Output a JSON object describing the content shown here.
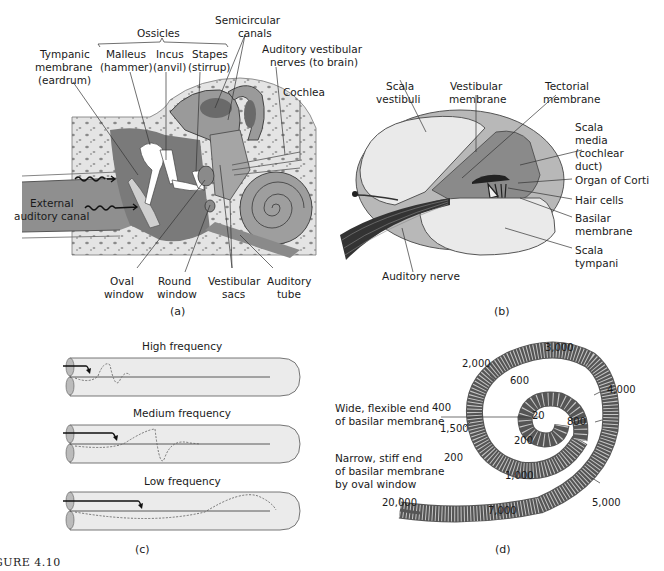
{
  "panel_a": {
    "letter": "(a)",
    "labels": {
      "ossicles": "Ossicles",
      "semicircular_1": "Semicircular",
      "semicircular_2": "canals",
      "tympanic_1": "Tympanic",
      "tympanic_2": "membrane",
      "tympanic_3": "(eardrum)",
      "malleus_1": "Malleus",
      "malleus_2": "(hammer)",
      "incus_1": "Incus",
      "incus_2": "(anvil)",
      "stapes_1": "Stapes",
      "stapes_2": "(stirrup)",
      "auditory_vestibular_1": "Auditory vestibular",
      "auditory_vestibular_2": "nerves (to brain)",
      "cochlea": "Cochlea",
      "external_1": "External",
      "external_2": "auditory canal",
      "oval_1": "Oval",
      "oval_2": "window",
      "round_1": "Round",
      "round_2": "window",
      "vestibular_1": "Vestibular",
      "vestibular_2": "sacs",
      "auditory_tube_1": "Auditory",
      "auditory_tube_2": "tube"
    }
  },
  "panel_b": {
    "letter": "(b)",
    "labels": {
      "scala_vestibuli_1": "Scala",
      "scala_vestibuli_2": "vestibuli",
      "vestibular_membrane_1": "Vestibular",
      "vestibular_membrane_2": "membrane",
      "tectorial_1": "Tectorial",
      "tectorial_2": "membrane",
      "scala_media_1": "Scala",
      "scala_media_2": "media",
      "scala_media_3": "(cochlear",
      "scala_media_4": "duct)",
      "organ_of_corti": "Organ of Corti",
      "hair_cells": "Hair cells",
      "basilar_1": "Basilar",
      "basilar_2": "membrane",
      "scala_tympani_1": "Scala",
      "scala_tympani_2": "tympani",
      "auditory_nerve": "Auditory nerve"
    }
  },
  "panel_c": {
    "letter": "(c)",
    "rows": [
      {
        "title": "High frequency"
      },
      {
        "title": "Medium frequency"
      },
      {
        "title": "Low frequency"
      }
    ]
  },
  "panel_d": {
    "letter": "(d)",
    "wide_end_1": "Wide, flexible end",
    "wide_end_2": "of basilar membrane",
    "narrow_end_1": "Narrow, stiff end",
    "narrow_end_2": "of basilar membrane",
    "narrow_end_3": "by oval window",
    "frequencies": {
      "f20": "20",
      "f200a": "200",
      "f200b": "200",
      "f400": "400",
      "f600": "600",
      "f800": "800",
      "f1000": "1,000",
      "f1500": "1,500",
      "f2000": "2,000",
      "f3000": "3,000",
      "f4000": "4,000",
      "f5000": "5,000",
      "f7000": "7,000",
      "f20000": "20,000"
    }
  },
  "caption": {
    "figure_id": "GURE 4.10",
    "text": "Structures of the ear and the cochlea, showing how different frequencies stimulate the basilar membrane."
  }
}
